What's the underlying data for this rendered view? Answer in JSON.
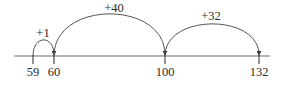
{
  "diagram": {
    "type": "number-line-jumps",
    "line": {
      "x1": 14,
      "x2": 270,
      "y": 56
    },
    "ticks": [
      {
        "value": "59",
        "x": 33
      },
      {
        "value": "60",
        "x": 54
      },
      {
        "value": "100",
        "x": 165
      },
      {
        "value": "132",
        "x": 259
      }
    ],
    "jumps": [
      {
        "label": "+1",
        "from": "59",
        "to": "60",
        "x1": 33,
        "x2": 54,
        "peak": 40,
        "label_x": 43,
        "label_y": 37
      },
      {
        "label": "+40",
        "from": "60",
        "to": "100",
        "x1": 54,
        "x2": 165,
        "peak": 14,
        "label_x": 114,
        "label_y": 12
      },
      {
        "label": "+32",
        "from": "100",
        "to": "132",
        "x1": 165,
        "x2": 259,
        "peak": 24,
        "label_x": 211,
        "label_y": 20
      }
    ],
    "colors": {
      "line": "#6a6a6a",
      "arc": "#555555",
      "text": "#2a2a2a"
    }
  }
}
